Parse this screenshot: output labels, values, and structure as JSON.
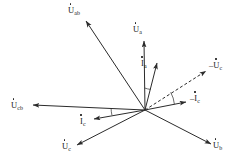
{
  "figure": {
    "type": "phasor-diagram",
    "title": "",
    "background_color": "#ffffff",
    "line_color": "#2b2b2b",
    "width": 241,
    "height": 165,
    "origin": {
      "x": 145,
      "y": 110
    }
  },
  "labels": {
    "u_ab": {
      "sign": "",
      "symbol": "U",
      "sub": "ab",
      "text": "U̇ab"
    },
    "u_a": {
      "sign": "",
      "symbol": "U",
      "sub": "a",
      "text": "U̇a"
    },
    "i_a": {
      "sign": "",
      "symbol": "I",
      "sub": "a",
      "text": "İa"
    },
    "neg_u_c": {
      "sign": "–",
      "symbol": "U",
      "sub": "c",
      "text": "–U̇c"
    },
    "neg_i_c": {
      "sign": "–",
      "symbol": "I",
      "sub": "c",
      "text": "–İc"
    },
    "u_cb": {
      "sign": "",
      "symbol": "U",
      "sub": "cb",
      "text": "U̇cb"
    },
    "i_c": {
      "sign": "",
      "symbol": "I",
      "sub": "c",
      "text": "İc"
    },
    "u_c": {
      "sign": "",
      "symbol": "U",
      "sub": "c",
      "text": "U̇c"
    },
    "u_b": {
      "sign": "",
      "symbol": "U",
      "sub": "b",
      "text": "U̇b"
    }
  },
  "chart_data": {
    "type": "scatter",
    "xlabel": "",
    "ylabel": "",
    "origin": {
      "x": 145,
      "y": 110
    },
    "vectors": [
      {
        "name": "u_ab",
        "label": "U̇ab",
        "tip": {
          "x": 86,
          "y": 21
        },
        "style": "solid",
        "kind": "voltage"
      },
      {
        "name": "u_a",
        "label": "U̇a",
        "tip": {
          "x": 144,
          "y": 41
        },
        "style": "solid",
        "kind": "voltage"
      },
      {
        "name": "i_a",
        "label": "İa",
        "tip": {
          "x": 157,
          "y": 63
        },
        "style": "solid",
        "kind": "current"
      },
      {
        "name": "neg_u_c",
        "label": "–U̇c",
        "tip": {
          "x": 206,
          "y": 71
        },
        "style": "dashed",
        "kind": "voltage"
      },
      {
        "name": "neg_i_c",
        "label": "–İc",
        "tip": {
          "x": 186,
          "y": 102
        },
        "style": "solid",
        "kind": "current"
      },
      {
        "name": "u_cb",
        "label": "U̇cb",
        "tip": {
          "x": 33,
          "y": 105
        },
        "style": "solid",
        "kind": "voltage"
      },
      {
        "name": "i_c",
        "label": "İc",
        "tip": {
          "x": 94,
          "y": 119
        },
        "style": "solid",
        "kind": "current"
      },
      {
        "name": "u_c",
        "label": "U̇c",
        "tip": {
          "x": 77,
          "y": 145
        },
        "style": "solid",
        "kind": "voltage"
      },
      {
        "name": "u_b",
        "label": "U̇b",
        "tip": {
          "x": 211,
          "y": 144
        },
        "style": "solid",
        "kind": "voltage"
      }
    ],
    "angle_arcs": [
      {
        "name": "arc-ua-ia",
        "between": [
          "u_a",
          "i_a"
        ],
        "radius": 22
      },
      {
        "name": "arc-negic-neguc",
        "between": [
          "neg_i_c",
          "neg_u_c"
        ],
        "radius": 30
      },
      {
        "name": "arc-ucb-ic",
        "between": [
          "u_cb",
          "i_c"
        ],
        "radius": 34
      }
    ]
  }
}
